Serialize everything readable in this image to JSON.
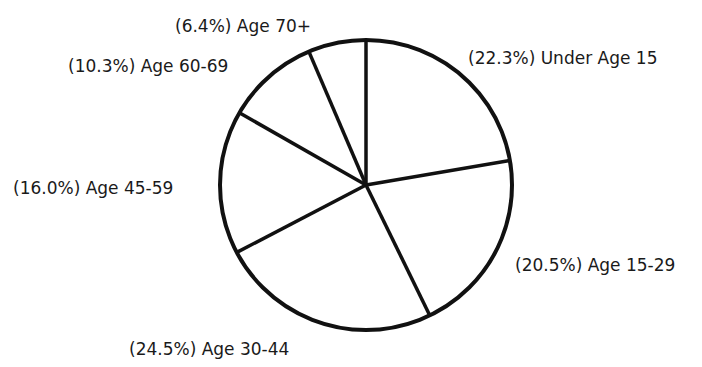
{
  "chart_data": {
    "type": "pie",
    "title": "",
    "start_angle_deg": 0,
    "direction": "clockwise",
    "slices": [
      {
        "label": "Under Age 15",
        "value": 22.3,
        "display": "(22.3%) Under Age 15"
      },
      {
        "label": "Age 15-29",
        "value": 20.5,
        "display": "(20.5%) Age 15-29"
      },
      {
        "label": "Age 30-44",
        "value": 24.5,
        "display": "(24.5%) Age 30-44"
      },
      {
        "label": "Age 45-59",
        "value": 16.0,
        "display": "(16.0%) Age 45-59"
      },
      {
        "label": "Age 60-69",
        "value": 10.3,
        "display": "(10.3%) Age 60-69"
      },
      {
        "label": "Age 70+",
        "value": 6.4,
        "display": "(6.4%) Age 70+"
      }
    ],
    "categories": [
      "Under Age 15",
      "Age 15-29",
      "Age 30-44",
      "Age 45-59",
      "Age 60-69",
      "Age 70+"
    ],
    "values": [
      22.3,
      20.5,
      24.5,
      16.0,
      10.3,
      6.4
    ],
    "fill_color": "#ffffff",
    "stroke_color": "#111111",
    "legend": "none (labels placed next to slices)"
  },
  "labels": {
    "under15": "(22.3%) Under Age 15",
    "a15_29": "(20.5%) Age 15-29",
    "a30_44": "(24.5%) Age 30-44",
    "a45_59": "(16.0%) Age 45-59",
    "a60_69": "(10.3%) Age 60-69",
    "a70": "(6.4%) Age 70+"
  }
}
